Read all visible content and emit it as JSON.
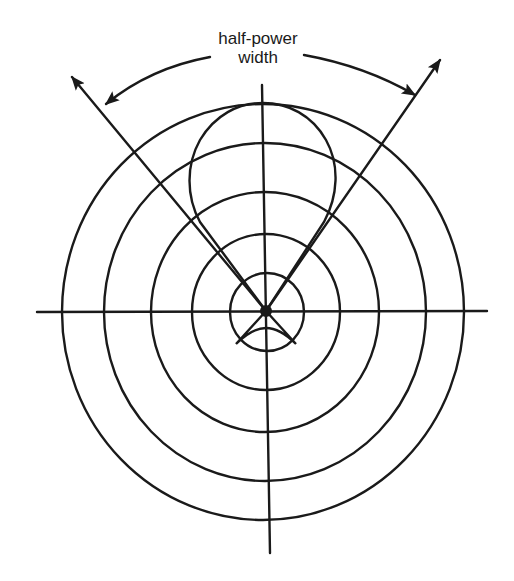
{
  "diagram": {
    "title_lines": [
      "half-power",
      "width"
    ],
    "colors": {
      "ink": "#1a1a1a",
      "background": "#ffffff"
    },
    "center": {
      "x": 265,
      "y": 312
    },
    "ring_radii": [
      38,
      75,
      116,
      163,
      205
    ],
    "axes": {
      "horizontal": {
        "x1": 37,
        "x2": 487,
        "y": 312
      },
      "vertical": {
        "x": 265,
        "y1": 85,
        "y2": 553
      }
    },
    "main_lobe": "circular lobe extending upward from center to top of outer ring",
    "back_lobe": "small lobe below center",
    "half_power_lines": [
      {
        "from": [
          265,
          312
        ],
        "to": [
          69,
          73
        ]
      },
      {
        "from": [
          265,
          312
        ],
        "to": [
          443,
          56
        ]
      }
    ],
    "annotation_arc": {
      "label": "half-power width"
    }
  }
}
